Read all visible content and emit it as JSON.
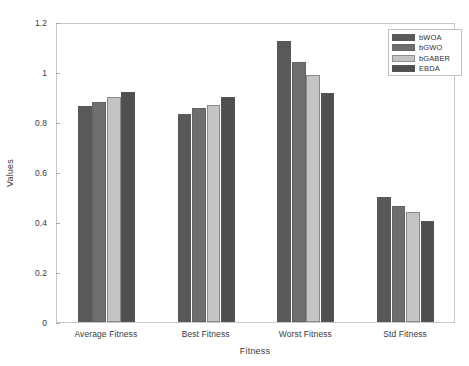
{
  "chart_data": {
    "type": "bar",
    "title": "",
    "xlabel": "Fitness",
    "ylabel": "Values",
    "categories": [
      "Average Fitness",
      "Best Fitness",
      "Worst Fitness",
      "Std Fitness"
    ],
    "series": [
      {
        "name": "bWOA",
        "color": "#595959",
        "values": [
          0.863,
          0.834,
          1.125,
          0.501
        ]
      },
      {
        "name": "bGWO",
        "color": "#6e6e6e",
        "values": [
          0.88,
          0.855,
          1.04,
          0.464
        ]
      },
      {
        "name": "bGABER",
        "color": "#c4c4c4",
        "values": [
          0.902,
          0.869,
          0.988,
          0.44
        ]
      },
      {
        "name": "EBDA",
        "color": "#4f4f4f",
        "values": [
          0.922,
          0.9,
          0.915,
          0.404
        ]
      }
    ],
    "ylim": [
      0,
      1.2
    ],
    "yticks": [
      0,
      0.2,
      0.4,
      0.6,
      0.8,
      1,
      1.2
    ],
    "ytick_labels": [
      "0",
      "0.2",
      "0.4",
      "0.6",
      "0.8",
      "1",
      "1.2"
    ],
    "grid": false,
    "legend_position": "top-right"
  },
  "legend": {
    "entries": [
      "bWOA",
      "bGWO",
      "bGABER",
      "EBDA"
    ]
  }
}
